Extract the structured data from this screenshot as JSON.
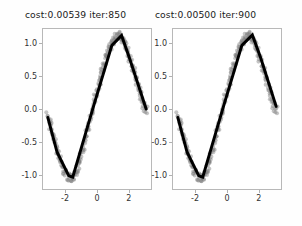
{
  "figure": {
    "background": "#fefefe",
    "axes_background": "#ffffff",
    "spine_color": "#b8b8b8",
    "scatter_color": "#7f7f7f",
    "line_color": "#000000"
  },
  "subplots": [
    {
      "id": "left",
      "title": "cost:0.00539  iter:850",
      "cost": "0.00539",
      "iter": "850",
      "ytick_labels": [
        "1.0",
        "0.5",
        "0.0",
        "-0.5",
        "-1.0"
      ],
      "xtick_labels": [
        "-2",
        "0",
        "2"
      ]
    },
    {
      "id": "right",
      "title": "cost:0.00500  iter:900",
      "cost": "0.00500",
      "iter": "900",
      "ytick_labels": [
        "1.0",
        "0.5",
        "0.0",
        "-0.5",
        "-1.0"
      ],
      "xtick_labels": [
        "-2",
        "0",
        "2"
      ]
    }
  ],
  "chart_data": [
    {
      "type": "scatter",
      "title": "cost:0.00539  iter:850",
      "xlabel": "",
      "ylabel": "",
      "xlim": [
        -3.45,
        3.45
      ],
      "ylim": [
        -1.22,
        1.22
      ],
      "xticks": [
        -2,
        0,
        2
      ],
      "yticks": [
        -1.0,
        -0.5,
        0.0,
        0.5,
        1.0
      ],
      "grid": false,
      "legend": null,
      "series": [
        {
          "name": "noisy samples",
          "kind": "scatter",
          "color": "#7f7f7f",
          "alpha": 0.45,
          "marker_size": 3.2,
          "x": [
            -3.14,
            -3.05,
            -2.96,
            -2.87,
            -2.78,
            -2.7,
            -2.61,
            -2.52,
            -2.43,
            -2.34,
            -2.25,
            -2.16,
            -2.07,
            -1.98,
            -1.9,
            -1.81,
            -1.72,
            -1.63,
            -1.54,
            -1.45,
            -1.36,
            -1.27,
            -1.19,
            -1.1,
            -1.01,
            -0.92,
            -0.83,
            -0.74,
            -0.65,
            -0.56,
            -0.48,
            -0.39,
            -0.3,
            -0.21,
            -0.12,
            -0.03,
            0.06,
            0.15,
            0.23,
            0.32,
            0.41,
            0.5,
            0.59,
            0.68,
            0.77,
            0.86,
            0.94,
            1.03,
            1.12,
            1.21,
            1.3,
            1.39,
            1.48,
            1.57,
            1.65,
            1.74,
            1.83,
            1.92,
            2.01,
            2.1,
            2.19,
            2.28,
            2.36,
            2.45,
            2.54,
            2.63,
            2.72,
            2.81,
            2.9,
            2.99,
            3.07,
            3.14
          ],
          "y": [
            -0.11,
            -0.18,
            -0.26,
            -0.34,
            -0.42,
            -0.5,
            -0.57,
            -0.65,
            -0.72,
            -0.78,
            -0.85,
            -0.9,
            -0.95,
            -0.99,
            -1.02,
            -1.04,
            -1.06,
            -1.05,
            -1.04,
            -1.01,
            -0.97,
            -0.92,
            -0.86,
            -0.79,
            -0.72,
            -0.64,
            -0.56,
            -0.47,
            -0.38,
            -0.29,
            -0.2,
            -0.11,
            -0.02,
            0.07,
            0.16,
            0.25,
            0.33,
            0.42,
            0.5,
            0.58,
            0.65,
            0.72,
            0.79,
            0.85,
            0.91,
            0.96,
            1.0,
            1.04,
            1.07,
            1.1,
            1.11,
            1.12,
            1.11,
            1.09,
            1.06,
            1.02,
            0.97,
            0.91,
            0.85,
            0.78,
            0.71,
            0.64,
            0.57,
            0.49,
            0.42,
            0.35,
            0.28,
            0.21,
            0.14,
            0.07,
            0.02,
            -0.01
          ]
        },
        {
          "name": "network fit",
          "kind": "line",
          "color": "#000000",
          "linewidth": 3.0,
          "x": [
            -3.14,
            -2.55,
            -1.8,
            -1.55,
            -0.3,
            0.95,
            1.57,
            2.1,
            3.14
          ],
          "y": [
            -0.13,
            -0.66,
            -1.02,
            -1.04,
            -0.02,
            0.97,
            1.12,
            0.76,
            0.0
          ]
        }
      ]
    },
    {
      "type": "scatter",
      "title": "cost:0.00500  iter:900",
      "xlabel": "",
      "ylabel": "",
      "xlim": [
        -3.45,
        3.45
      ],
      "ylim": [
        -1.22,
        1.22
      ],
      "xticks": [
        -2,
        0,
        2
      ],
      "yticks": [
        -1.0,
        -0.5,
        0.0,
        0.5,
        1.0
      ],
      "grid": false,
      "legend": null,
      "series": [
        {
          "name": "noisy samples",
          "kind": "scatter",
          "color": "#7f7f7f",
          "alpha": 0.45,
          "marker_size": 3.2,
          "x": [
            -3.14,
            -3.05,
            -2.96,
            -2.87,
            -2.78,
            -2.7,
            -2.61,
            -2.52,
            -2.43,
            -2.34,
            -2.25,
            -2.16,
            -2.07,
            -1.98,
            -1.9,
            -1.81,
            -1.72,
            -1.63,
            -1.54,
            -1.45,
            -1.36,
            -1.27,
            -1.19,
            -1.1,
            -1.01,
            -0.92,
            -0.83,
            -0.74,
            -0.65,
            -0.56,
            -0.48,
            -0.39,
            -0.3,
            -0.21,
            -0.12,
            -0.03,
            0.06,
            0.15,
            0.23,
            0.32,
            0.41,
            0.5,
            0.59,
            0.68,
            0.77,
            0.86,
            0.94,
            1.03,
            1.12,
            1.21,
            1.3,
            1.39,
            1.48,
            1.57,
            1.65,
            1.74,
            1.83,
            1.92,
            2.01,
            2.1,
            2.19,
            2.28,
            2.36,
            2.45,
            2.54,
            2.63,
            2.72,
            2.81,
            2.9,
            2.99,
            3.07,
            3.14
          ],
          "y": [
            -0.11,
            -0.18,
            -0.26,
            -0.34,
            -0.42,
            -0.5,
            -0.57,
            -0.65,
            -0.72,
            -0.78,
            -0.85,
            -0.9,
            -0.95,
            -0.99,
            -1.02,
            -1.04,
            -1.06,
            -1.05,
            -1.04,
            -1.01,
            -0.97,
            -0.92,
            -0.86,
            -0.79,
            -0.72,
            -0.64,
            -0.56,
            -0.47,
            -0.38,
            -0.29,
            -0.2,
            -0.11,
            -0.02,
            0.07,
            0.16,
            0.25,
            0.33,
            0.42,
            0.5,
            0.58,
            0.65,
            0.72,
            0.79,
            0.85,
            0.91,
            0.96,
            1.0,
            1.04,
            1.07,
            1.1,
            1.11,
            1.12,
            1.11,
            1.09,
            1.06,
            1.02,
            0.97,
            0.91,
            0.85,
            0.78,
            0.71,
            0.64,
            0.57,
            0.49,
            0.42,
            0.35,
            0.28,
            0.21,
            0.14,
            0.07,
            0.02,
            -0.01
          ]
        },
        {
          "name": "network fit",
          "kind": "line",
          "color": "#000000",
          "linewidth": 3.0,
          "x": [
            -3.14,
            -2.55,
            -1.8,
            -1.55,
            -0.3,
            0.95,
            1.62,
            2.15,
            3.14
          ],
          "y": [
            -0.13,
            -0.66,
            -1.02,
            -1.04,
            -0.02,
            0.97,
            1.13,
            0.78,
            0.04
          ]
        }
      ]
    }
  ]
}
